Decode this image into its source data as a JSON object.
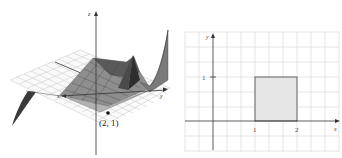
{
  "left_figure": {
    "description": "3D surface plot over xy-plane with highlighted point",
    "axes": {
      "x_label": "x",
      "y_label": "y",
      "z_label": "z"
    },
    "point": {
      "label": "(2, 1)",
      "x": 2,
      "y": 1
    }
  },
  "right_figure": {
    "description": "2D grid with shaded rectangle",
    "axes": {
      "x_label": "x",
      "y_label": "y"
    },
    "ticks": {
      "x": [
        "1",
        "2"
      ],
      "y": [
        "1"
      ]
    },
    "shaded_region": {
      "x_min": 1,
      "x_max": 2,
      "y_min": 0,
      "y_max": 1,
      "fill": "#e6e6e6",
      "stroke": "#555555"
    }
  },
  "colors": {
    "grid": "#c8c8c8",
    "axis": "#333333",
    "surface_dark": "#3a3a3a",
    "surface_mid": "#8a8a8a"
  }
}
